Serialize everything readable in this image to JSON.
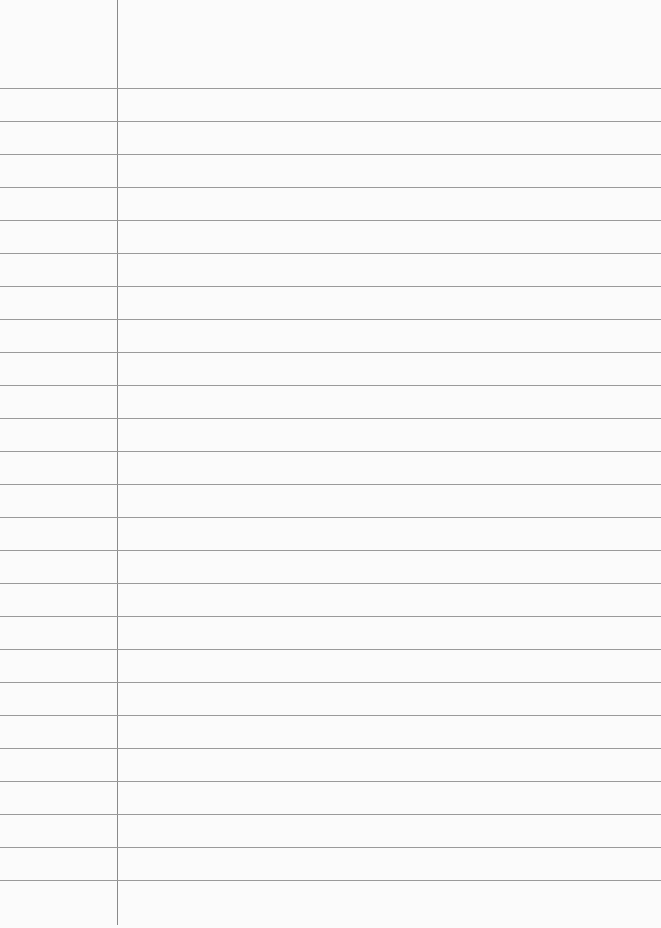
{
  "paper": {
    "type": "lined-paper",
    "margin_x": 117,
    "first_line_y": 88,
    "line_spacing": 33,
    "line_count": 25,
    "line_color": "#9a9a9a",
    "margin_color": "#8a8a8a",
    "background": "#fbfbfb"
  }
}
